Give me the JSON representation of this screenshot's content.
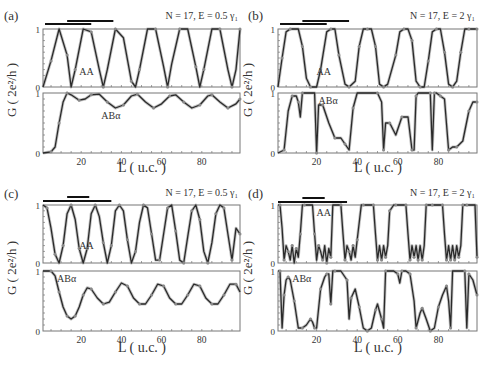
{
  "figure": {
    "y_axis_label": "G ( 2e²/h )",
    "x_axis_label": "L ( u.c. )",
    "line_color": "#2a2a2a",
    "marker_color": "#8a8a8a",
    "frame_color": "#777777"
  },
  "chart_data": [
    {
      "type": "line",
      "panel": "(a)",
      "annotation": "N = 17, E = 0.5 γ₁",
      "xlabel": "L ( u.c. )",
      "ylabel": "G ( 2e²/h )",
      "xlim": [
        1,
        99
      ],
      "xticks": [
        20,
        40,
        60,
        80
      ],
      "bars": [
        [
          2,
          25
        ],
        [
          13,
          36
        ]
      ],
      "subplots": [
        {
          "name": "AA",
          "ylim": [
            0,
            1
          ],
          "yticks": [
            0,
            1
          ],
          "x": [
            1,
            5,
            9,
            13,
            15,
            17,
            21,
            25,
            29,
            31,
            33,
            37,
            41,
            45,
            47,
            49,
            53,
            57,
            61,
            63,
            65,
            69,
            73,
            77,
            79,
            81,
            85,
            89,
            93,
            95,
            97,
            99
          ],
          "y": [
            0,
            0.45,
            1,
            0.55,
            0,
            0.3,
            1,
            0.95,
            0.3,
            0,
            0.3,
            1,
            0.85,
            0.1,
            0,
            0.3,
            1,
            1,
            0.35,
            0,
            0.4,
            1,
            1,
            0.35,
            0,
            0.3,
            1,
            1,
            0.3,
            0,
            0.3,
            1
          ]
        },
        {
          "name": "ABα",
          "ylim": [
            0,
            1
          ],
          "yticks": [
            0,
            1
          ],
          "x": [
            1,
            5,
            7,
            9,
            11,
            13,
            15,
            19,
            22,
            25,
            29,
            33,
            37,
            41,
            45,
            48,
            52,
            56,
            60,
            64,
            67,
            71,
            75,
            79,
            83,
            85,
            89,
            93,
            97,
            99
          ],
          "y": [
            0,
            0.02,
            0.1,
            0.5,
            0.85,
            1,
            0.97,
            0.88,
            0.9,
            0.97,
            0.98,
            0.85,
            0.75,
            0.8,
            0.95,
            0.98,
            0.85,
            0.75,
            0.82,
            0.95,
            0.97,
            0.85,
            0.75,
            0.8,
            0.95,
            0.97,
            0.85,
            0.75,
            0.82,
            0.9
          ]
        }
      ]
    },
    {
      "type": "line",
      "panel": "(b)",
      "annotation": "N = 17, E = 2 γ₁",
      "xlabel": "L ( u.c. )",
      "ylabel": "G ( 2e²/h )",
      "xlim": [
        1,
        99
      ],
      "xticks": [
        20,
        40,
        60,
        80
      ],
      "bars": [
        [
          2,
          25
        ],
        [
          13,
          36
        ]
      ],
      "subplots": [
        {
          "name": "AA",
          "ylim": [
            0,
            1
          ],
          "yticks": [
            0,
            1
          ],
          "x": [
            1,
            3,
            5,
            7,
            11,
            13,
            15,
            17,
            20,
            22,
            25,
            27,
            29,
            31,
            34,
            36,
            39,
            41,
            43,
            45,
            47,
            49,
            51,
            53,
            55,
            59,
            61,
            63,
            65,
            67,
            69,
            71,
            73,
            75,
            77,
            79,
            81,
            83,
            85,
            87,
            89,
            91,
            93,
            95,
            97,
            99
          ],
          "y": [
            0,
            0.5,
            0.95,
            1,
            1,
            0.7,
            0.15,
            0,
            0,
            0.3,
            0.95,
            1,
            1,
            0.55,
            0.05,
            0,
            0.1,
            0.7,
            1,
            1,
            1,
            0.7,
            0.05,
            0,
            0.05,
            0.55,
            0.95,
            1,
            1,
            0.8,
            0.1,
            0,
            0,
            0.45,
            0.95,
            1,
            1,
            0.6,
            0.05,
            0,
            0.1,
            0.6,
            1,
            1,
            1,
            1
          ]
        },
        {
          "name": "ABα",
          "ylim": [
            0,
            1
          ],
          "yticks": [
            0,
            1
          ],
          "x": [
            1,
            4,
            6,
            8,
            10,
            11,
            12,
            13,
            19,
            20,
            21,
            23,
            26,
            29,
            32,
            34,
            36,
            38,
            40,
            50,
            52,
            53,
            54,
            56,
            59,
            62,
            65,
            67,
            68,
            69,
            70,
            76,
            77,
            78,
            79,
            81,
            83,
            85,
            87,
            89,
            92,
            95,
            97,
            99
          ],
          "y": [
            0,
            0.05,
            0.7,
            0.95,
            0.95,
            0.85,
            0.6,
            1,
            1,
            0,
            0.8,
            0.8,
            0.5,
            0.25,
            0.25,
            0.15,
            0.05,
            0.75,
            1,
            1,
            0.85,
            0.05,
            0.5,
            0.5,
            0.3,
            0.6,
            0.6,
            0.05,
            0.05,
            0.95,
            1,
            1,
            0.05,
            1,
            1,
            0.95,
            0.9,
            0.05,
            0.1,
            0.1,
            0.2,
            0.7,
            0.85,
            0.85
          ]
        }
      ]
    },
    {
      "type": "line",
      "panel": "(c)",
      "annotation": "N = 17, E = 0.5 γ₁",
      "xlabel": "L ( u.c. )",
      "ylabel": "G ( 2e²/h )",
      "xlim": [
        1,
        99
      ],
      "xticks": [
        20,
        40,
        60,
        80
      ],
      "bars": [
        [
          1,
          35
        ],
        [
          13,
          24
        ]
      ],
      "subplots": [
        {
          "name": "AA",
          "ylim": [
            0,
            1
          ],
          "yticks": [
            0,
            1
          ],
          "x": [
            1,
            3,
            5,
            7,
            9,
            11,
            13,
            15,
            17,
            19,
            21,
            23,
            25,
            27,
            29,
            31,
            33,
            35,
            37,
            39,
            41,
            43,
            45,
            47,
            49,
            51,
            53,
            55,
            57,
            59,
            61,
            63,
            65,
            67,
            69,
            71,
            73,
            75,
            77,
            79,
            81,
            83,
            85,
            87,
            89,
            91,
            93,
            95,
            97,
            99
          ],
          "y": [
            1,
            0.95,
            0.6,
            0.15,
            0,
            0.3,
            0.85,
            1,
            0.75,
            0.25,
            0,
            0.25,
            0.85,
            1,
            0.8,
            0.35,
            0,
            0.3,
            0.9,
            1,
            0.9,
            0.4,
            0,
            0.2,
            0.7,
            1,
            0.95,
            0.5,
            0.05,
            0.05,
            0.5,
            0.95,
            1,
            0.55,
            0.05,
            0,
            0.45,
            0.9,
            1,
            0.75,
            0.2,
            0,
            0.35,
            0.85,
            1,
            0.95,
            0.5,
            0.05,
            0.6,
            0.5
          ]
        },
        {
          "name": "ABα",
          "ylim": [
            0,
            1
          ],
          "yticks": [
            0,
            1
          ],
          "x": [
            1,
            5,
            7,
            9,
            11,
            13,
            15,
            17,
            19,
            21,
            23,
            25,
            28,
            31,
            34,
            37,
            40,
            43,
            46,
            49,
            52,
            55,
            58,
            61,
            64,
            67,
            70,
            73,
            76,
            79,
            82,
            85,
            88,
            91,
            94,
            97,
            99
          ],
          "y": [
            1,
            1,
            0.92,
            0.65,
            0.4,
            0.25,
            0.2,
            0.25,
            0.4,
            0.6,
            0.72,
            0.7,
            0.55,
            0.45,
            0.48,
            0.65,
            0.8,
            0.75,
            0.55,
            0.45,
            0.45,
            0.6,
            0.78,
            0.75,
            0.55,
            0.45,
            0.45,
            0.6,
            0.78,
            0.75,
            0.55,
            0.45,
            0.45,
            0.6,
            0.78,
            0.78,
            0.65
          ]
        }
      ]
    },
    {
      "type": "line",
      "panel": "(d)",
      "annotation": "N = 17, E = 2 γ₁",
      "xlabel": "L ( u.c. )",
      "ylabel": "G ( 2e²/h )",
      "xlim": [
        1,
        99
      ],
      "xticks": [
        20,
        40,
        60,
        80
      ],
      "bars": [
        [
          1,
          35
        ],
        [
          13,
          24
        ]
      ],
      "subplots": [
        {
          "name": "AA",
          "ylim": [
            0,
            1
          ],
          "yticks": [
            0,
            1
          ],
          "x": [
            1,
            2,
            3,
            4,
            5,
            6,
            7,
            8,
            9,
            10,
            11,
            12,
            13,
            14,
            18,
            19,
            20,
            21,
            22,
            23,
            24,
            25,
            26,
            27,
            28,
            32,
            33,
            34,
            35,
            36,
            37,
            38,
            39,
            40,
            42,
            43,
            44,
            48,
            49,
            50,
            51,
            52,
            53,
            54,
            55,
            56,
            58,
            59,
            60,
            64,
            65,
            66,
            67,
            68,
            69,
            70,
            71,
            72,
            73,
            74,
            76,
            77,
            78,
            82,
            83,
            84,
            85,
            86,
            87,
            88,
            89,
            90,
            91,
            92,
            93,
            94,
            98,
            99
          ],
          "y": [
            1,
            1,
            0.6,
            0.05,
            0.3,
            0.2,
            0.05,
            0.3,
            0,
            0.25,
            0.1,
            0.5,
            1,
            1,
            1,
            0.5,
            0.05,
            0.3,
            0.2,
            0.05,
            0.3,
            0,
            0.25,
            0.1,
            1,
            1,
            0.5,
            0.05,
            0.3,
            0.2,
            0.05,
            0.3,
            0.1,
            0.4,
            1,
            1,
            1,
            1,
            0.5,
            0.05,
            0.3,
            0.05,
            0.3,
            0.1,
            0.3,
            0.9,
            1,
            1,
            1,
            1,
            0.5,
            0.05,
            0.3,
            0.1,
            0.3,
            0.05,
            0.3,
            0.05,
            0.3,
            1,
            1,
            1,
            1,
            1,
            0.5,
            0.05,
            0.3,
            0.05,
            0.3,
            0.05,
            0.3,
            0.1,
            0.3,
            1,
            1,
            1,
            1,
            0.1,
            0.3
          ]
        },
        {
          "name": "ABα",
          "ylim": [
            0,
            1
          ],
          "yticks": [
            0,
            1
          ],
          "x": [
            1,
            2,
            3,
            4,
            5,
            6,
            7,
            9,
            11,
            13,
            15,
            17,
            18,
            19,
            20,
            22,
            24,
            25,
            26,
            27,
            28,
            29,
            32,
            35,
            36,
            37,
            39,
            41,
            43,
            45,
            47,
            49,
            50,
            52,
            53,
            54,
            58,
            60,
            61,
            62,
            64,
            66,
            68,
            69,
            71,
            72,
            74,
            76,
            78,
            80,
            82,
            84,
            85,
            86,
            87,
            93,
            94,
            95,
            97,
            99
          ],
          "y": [
            1,
            1,
            0.05,
            0.6,
            0.85,
            0.9,
            0.85,
            0.5,
            0.05,
            0.05,
            0.1,
            0.2,
            0.15,
            0.05,
            0.05,
            0.7,
            0.9,
            0.95,
            0.95,
            0.45,
            1,
            1,
            1,
            0.85,
            0.2,
            0.55,
            0.7,
            0.4,
            0.05,
            0,
            0.05,
            0.35,
            0.45,
            0.2,
            0.05,
            1,
            1,
            0.95,
            0.8,
            1,
            1,
            0.95,
            0.5,
            0.05,
            0.3,
            0.38,
            0.2,
            0,
            0.05,
            0.4,
            0.6,
            0.75,
            0.5,
            0.05,
            1,
            1,
            0.05,
            0.95,
            0.85,
            0.6
          ]
        }
      ]
    }
  ]
}
